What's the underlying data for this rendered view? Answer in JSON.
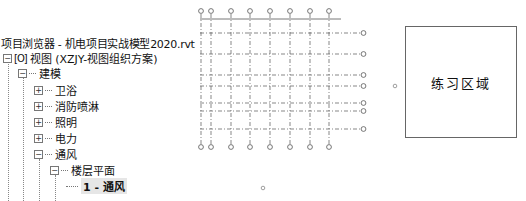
{
  "project_browser": {
    "title": "项目浏览器 - 机电项目实战模型2020.rvt",
    "root": {
      "icon": "view-icon",
      "label": "视图 (XZJY-视图组织方案)",
      "expanded": true
    },
    "items": [
      {
        "label": "建模",
        "expanded": true,
        "level": 1
      },
      {
        "label": "卫浴",
        "expanded": false,
        "level": 2
      },
      {
        "label": "消防喷淋",
        "expanded": false,
        "level": 2
      },
      {
        "label": "照明",
        "expanded": false,
        "level": 2
      },
      {
        "label": "电力",
        "expanded": false,
        "level": 2
      },
      {
        "label": "通风",
        "expanded": true,
        "level": 2
      },
      {
        "label": "楼层平面",
        "expanded": true,
        "level": 3
      },
      {
        "label": "1 - 通风",
        "selected": true,
        "level": 4
      }
    ],
    "expand_glyph": "+",
    "collapse_glyph": "−"
  },
  "canvas": {
    "practice_area_label": "练习区域",
    "grid_color": "#555555"
  }
}
